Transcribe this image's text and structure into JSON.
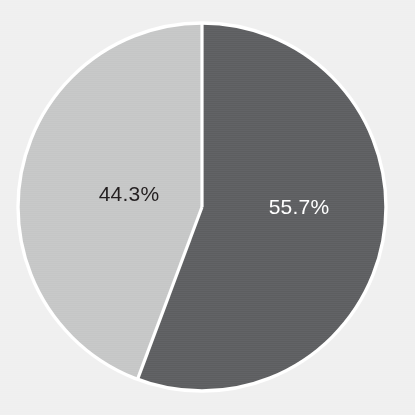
{
  "chart_data": {
    "type": "pie",
    "title": "",
    "subtitle": "",
    "xlabel": "",
    "ylabel": "",
    "grid": false,
    "legend": false,
    "legend_position": "none",
    "start_angle_deg": 0,
    "direction": "clockwise",
    "categories": [
      "Segment 1",
      "Segment 2"
    ],
    "values": [
      55.7,
      44.3
    ],
    "units": "percent",
    "slices": [
      {
        "name": "dark-slice",
        "label": "55.7%",
        "value": 55.7,
        "color": "#5f6062",
        "label_color": "#ffffff",
        "label_x": 299,
        "label_y": 207
      },
      {
        "name": "light-slice",
        "label": "44.3%",
        "value": 44.3,
        "color": "#c6c7c7",
        "label_color": "#231f20",
        "label_x": 129,
        "label_y": 194
      }
    ],
    "annotations": []
  },
  "figure": {
    "background_color": "#f0f0f0",
    "separator_color": "#ffffff",
    "outline_color": "#ffffff",
    "center_x": 202,
    "center_y": 207,
    "radius": 184
  }
}
